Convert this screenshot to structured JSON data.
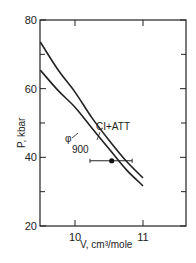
{
  "chart_data": {
    "type": "line",
    "title": "",
    "xlabel": "V, cm³/mole",
    "ylabel": "P, kbar",
    "xlim": [
      9.49,
      11.63
    ],
    "ylim": [
      20,
      80
    ],
    "x_ticks": [
      10,
      11
    ],
    "x_tick_labels": [
      "10",
      "11"
    ],
    "y_ticks": [
      20,
      40,
      60,
      80
    ],
    "y_tick_labels": [
      "20",
      "40",
      "60",
      "80"
    ],
    "y_minor_ticks": [
      30,
      50,
      70
    ],
    "grid": false,
    "legend": null,
    "series": [
      {
        "name": "CI+ATT",
        "x": [
          9.49,
          9.75,
          10.0,
          10.25,
          10.5,
          10.75,
          11.0
        ],
        "y": [
          73.6,
          65.5,
          59.0,
          51.5,
          45.0,
          39.0,
          34.0
        ]
      },
      {
        "name": "φ 900",
        "x": [
          9.49,
          9.75,
          10.0,
          10.25,
          10.5,
          10.75,
          11.0
        ],
        "y": [
          65.4,
          59.5,
          54.6,
          48.5,
          42.5,
          36.5,
          31.7
        ]
      }
    ],
    "points": [
      {
        "name": "measured",
        "x": 10.54,
        "y": 39.0,
        "xerr": [
          10.22,
          10.84
        ]
      }
    ],
    "annotations": [
      {
        "text": "CI+ATT",
        "target_series": "CI+ATT"
      },
      {
        "text": "φ",
        "subscript": "900",
        "target_series": "φ 900"
      }
    ]
  }
}
